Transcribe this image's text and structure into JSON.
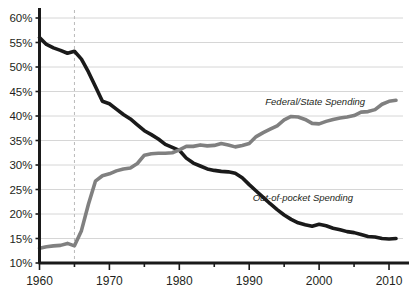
{
  "chart_data": {
    "type": "line",
    "title": "",
    "xlabel": "",
    "ylabel": "",
    "xlim": [
      1960,
      2012
    ],
    "ylim": [
      10,
      60
    ],
    "ytick_step": 5,
    "grid": true,
    "legend_position": "inline-annotation",
    "ytick_labels": [
      "60%",
      "55%",
      "50%",
      "45%",
      "40%",
      "35%",
      "30%",
      "25%",
      "20%",
      "15%",
      "10%"
    ],
    "ytick_values": [
      60,
      55,
      50,
      45,
      40,
      35,
      30,
      25,
      20,
      15,
      10
    ],
    "xtick_labels": [
      "1960",
      "1970",
      "1980",
      "1990",
      "2000",
      "2010"
    ],
    "xtick_values": [
      1960,
      1970,
      1980,
      1990,
      2000,
      2010
    ],
    "xminor_ticks": [
      1965,
      1975,
      1985,
      1995,
      2005
    ],
    "annotations": [
      {
        "name": "medicare-enactment-marker",
        "type": "vline",
        "x": 1965,
        "style": "dashed",
        "color": "#b9b9b9",
        "label": ""
      }
    ],
    "x": [
      1960,
      1961,
      1962,
      1963,
      1964,
      1965,
      1966,
      1967,
      1968,
      1969,
      1970,
      1971,
      1972,
      1973,
      1974,
      1975,
      1976,
      1977,
      1978,
      1979,
      1980,
      1981,
      1982,
      1983,
      1984,
      1985,
      1986,
      1987,
      1988,
      1989,
      1990,
      1991,
      1992,
      1993,
      1994,
      1995,
      1996,
      1997,
      1998,
      1999,
      2000,
      2001,
      2002,
      2003,
      2004,
      2005,
      2006,
      2007,
      2008,
      2009,
      2010,
      2011
    ],
    "series": [
      {
        "name": "Out-of-pocket Spending",
        "label": "Out-of-pocket Spending",
        "color": "#1a1a1a",
        "width": 3.6,
        "label_x": 1990.5,
        "label_y": 22.6,
        "values": [
          56.0,
          54.6,
          53.9,
          53.4,
          52.8,
          53.2,
          51.6,
          49.0,
          46.0,
          43.0,
          42.5,
          41.4,
          40.3,
          39.4,
          38.2,
          37.0,
          36.2,
          35.3,
          34.2,
          33.6,
          33.0,
          31.4,
          30.4,
          29.8,
          29.2,
          28.9,
          28.7,
          28.6,
          28.3,
          27.4,
          26.0,
          24.7,
          23.4,
          22.1,
          20.9,
          19.8,
          18.9,
          18.2,
          17.8,
          17.5,
          17.9,
          17.6,
          17.1,
          16.8,
          16.4,
          16.2,
          15.8,
          15.4,
          15.3,
          15.0,
          14.9,
          15.0
        ]
      },
      {
        "name": "Federal/State Spending",
        "label": "Federal/State Spending",
        "color": "#808080",
        "width": 3.6,
        "label_x": 1992.3,
        "label_y": 42.3,
        "values": [
          13.0,
          13.3,
          13.5,
          13.6,
          14.0,
          13.5,
          16.6,
          22.0,
          26.7,
          27.8,
          28.2,
          28.8,
          29.2,
          29.4,
          30.3,
          32.0,
          32.3,
          32.4,
          32.4,
          32.5,
          33.1,
          33.8,
          33.8,
          34.1,
          33.9,
          34.0,
          34.4,
          34.1,
          33.7,
          34.0,
          34.4,
          35.8,
          36.6,
          37.3,
          38.0,
          39.2,
          39.9,
          39.8,
          39.3,
          38.5,
          38.4,
          38.9,
          39.3,
          39.6,
          39.8,
          40.1,
          40.8,
          40.9,
          41.3,
          42.4,
          43.0,
          43.2
        ]
      }
    ]
  }
}
